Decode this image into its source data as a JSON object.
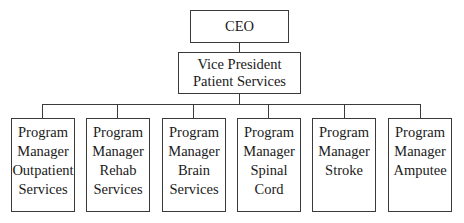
{
  "chart_title": "",
  "root": {
    "lines": [
      "CEO"
    ]
  },
  "vp": {
    "lines": [
      "Vice President",
      "Patient Services"
    ]
  },
  "children": [
    {
      "lines": [
        "Program",
        "Manager",
        "Outpatient",
        "Services"
      ]
    },
    {
      "lines": [
        "Program",
        "Manager",
        "Rehab",
        "Services"
      ]
    },
    {
      "lines": [
        "Program",
        "Manager",
        "Brain",
        "Services"
      ]
    },
    {
      "lines": [
        "Program",
        "Manager",
        "Spinal",
        "Cord"
      ]
    },
    {
      "lines": [
        "Program",
        "Manager",
        "Stroke"
      ]
    },
    {
      "lines": [
        "Program",
        "Manager",
        "Amputee"
      ]
    }
  ],
  "colors": {
    "border": "#3a3a3a",
    "text": "#1a1a1a",
    "background": "#ffffff"
  }
}
